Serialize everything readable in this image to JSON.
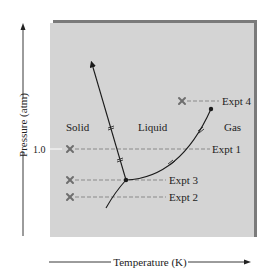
{
  "diagram": {
    "type": "phase-diagram",
    "colors": {
      "panel": "#d4d4d4",
      "panel_shadow": "#7a7a7a",
      "curve": "#1a1a1a",
      "dash": "#8a8a8a",
      "marker": "#6e6e6e",
      "tick": "#ffffff"
    },
    "axes": {
      "y_label": "Pressure (atm)",
      "x_label": "Temperature (K)",
      "y_tick": "1.0"
    },
    "regions": {
      "solid": "Solid",
      "liquid": "Liquid",
      "gas": "Gas"
    },
    "experiments": [
      {
        "label": "Expt 1"
      },
      {
        "label": "Expt 2"
      },
      {
        "label": "Expt 3"
      },
      {
        "label": "Expt 4"
      }
    ]
  }
}
